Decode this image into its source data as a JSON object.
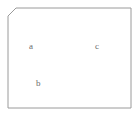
{
  "diagram": {
    "title": "",
    "background_color": "#ffffff",
    "shape": {
      "name": "folded-corner-rectangle",
      "stroke_color": "#9a9a9a",
      "fill_color": "#ffffff",
      "stroke_width": 1,
      "bounds": {
        "x": 8,
        "y": 8,
        "width": 123,
        "height": 100
      },
      "corner_fold": {
        "position": "top-left",
        "size": 8,
        "points": "8,16 16,8"
      },
      "outline_points": "8,16 16,8 131,8 131,108 8,108"
    },
    "labels": [
      {
        "id": "label-a",
        "text": "a",
        "x": 29,
        "y": 42,
        "color": "#6b6b6b"
      },
      {
        "id": "label-c",
        "text": "c",
        "x": 95,
        "y": 42,
        "color": "#6b6b6b"
      },
      {
        "id": "label-b",
        "text": "b",
        "x": 36,
        "y": 79,
        "color": "#6b6b6b"
      }
    ]
  }
}
